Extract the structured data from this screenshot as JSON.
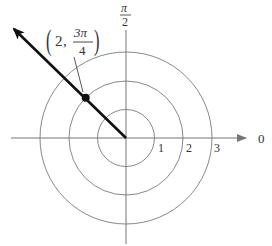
{
  "diagram": {
    "type": "polar-coordinate-plot",
    "center": {
      "x": 126,
      "y": 138
    },
    "unit_px": 28.7,
    "rings": [
      {
        "r": 1,
        "label": "1"
      },
      {
        "r": 2,
        "label": "2"
      },
      {
        "r": 3,
        "label": "3"
      }
    ],
    "polar_axis_label": "0",
    "vertical_axis_label": {
      "numerator": "π",
      "denominator": "2"
    },
    "point": {
      "r": 2,
      "theta_label_num": "3π",
      "theta_label_den": "4",
      "label_prefix": "(2, ",
      "label_suffix": ")"
    },
    "colors": {
      "rings": "#888888",
      "axes": "#777777",
      "ray": "#111111",
      "text": "#333333"
    }
  }
}
